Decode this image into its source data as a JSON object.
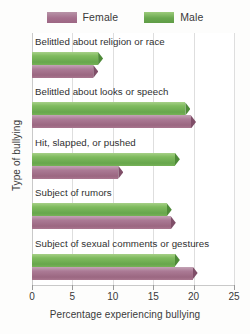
{
  "chart_data": {
    "type": "bar",
    "orientation": "horizontal",
    "title": "",
    "xlabel": "Percentage experiencing bullying",
    "ylabel": "Type of bullying",
    "xlim": [
      0,
      25
    ],
    "xticks": [
      0,
      5,
      10,
      15,
      20,
      25
    ],
    "grid": "vertical",
    "legend_position": "top-center",
    "categories": [
      "Belittled about religion or race",
      "Belittled about looks or speech",
      "Hit, slapped, or pushed",
      "Subject of rumors",
      "Subject of sexual comments or gestures"
    ],
    "series": [
      {
        "name": "Female",
        "color": "#a5708d",
        "values": [
          8.2,
          20.3,
          11.3,
          17.8,
          20.5
        ]
      },
      {
        "name": "Male",
        "color": "#6aa84f",
        "values": [
          8.8,
          19.6,
          18.3,
          17.3,
          18.3
        ]
      }
    ]
  },
  "legend": {
    "items": [
      {
        "label": "Female",
        "swatch": "female-legend-swatch"
      },
      {
        "label": "Male",
        "swatch": "male-legend-swatch"
      }
    ]
  },
  "axes": {
    "x": {
      "title": "Percentage experiencing bullying",
      "tick_labels": [
        "0",
        "5",
        "10",
        "15",
        "20",
        "25"
      ]
    },
    "y": {
      "title": "Type of bullying"
    }
  }
}
